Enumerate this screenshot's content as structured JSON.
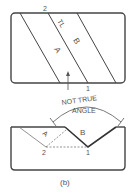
{
  "figure": {
    "caption": "(b)",
    "top_view": {
      "labels": {
        "point_2": "2",
        "true_length": "TL",
        "plane_a": "A",
        "plane_b": "B",
        "point_1": "1"
      }
    },
    "front_view": {
      "annotation_line1": "NOT TRUE",
      "annotation_line2": "ANGLE",
      "labels": {
        "plane_a": "A",
        "plane_b": "B",
        "point_2": "2",
        "point_1": "1"
      }
    },
    "colors": {
      "line": "#444444",
      "thin_line": "#777777",
      "text": "#555555"
    }
  }
}
